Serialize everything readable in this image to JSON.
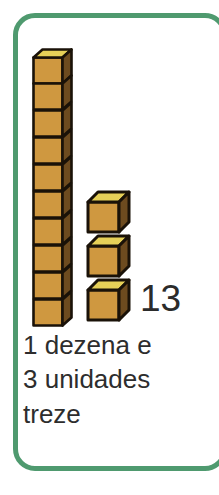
{
  "card": {
    "border_color": "#4f9a6f",
    "background_color": "#ffffff"
  },
  "illustration": {
    "kind": "base-ten-blocks",
    "description": "One ten-rod of 10 stacked cubes plus 3 loose unit cubes",
    "ten_rods": 1,
    "cubes_per_rod": 10,
    "loose_units": 3,
    "total": 13,
    "cube_colors": {
      "top_face": "#e6d058",
      "front_face": "#cf9840",
      "side_face": "#6d4b1f",
      "outline": "#1a1208"
    }
  },
  "numeral": {
    "value": "13",
    "color": "#2b2b2b"
  },
  "caption": {
    "lines": [
      "1 dezena e",
      "3 unidades",
      "treze"
    ],
    "color": "#2d2d2d"
  }
}
